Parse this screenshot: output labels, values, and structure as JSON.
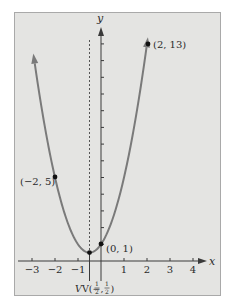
{
  "chart_data": {
    "type": "line",
    "title": "",
    "function": "y = 2x^2 + 2x + 1",
    "xlabel": "x",
    "ylabel": "y",
    "xlim": [
      -3.2,
      4.7
    ],
    "ylim": [
      -1,
      13.8
    ],
    "x_ticks": [
      -3,
      -2,
      -1,
      1,
      2,
      3,
      4
    ],
    "x_tick_labels": [
      "−3",
      "−2",
      "−1",
      "1",
      "2",
      "3",
      "4"
    ],
    "y_ticks": [
      1,
      2,
      3,
      4,
      5,
      6,
      7,
      8,
      9,
      10,
      11,
      12,
      13
    ],
    "y_tick_labels": [],
    "grid": false,
    "axis_of_symmetry": -0.5,
    "series": [
      {
        "name": "parabola",
        "x": [
          -2.95,
          -2,
          -1,
          -0.5,
          0,
          1,
          2,
          2.05
        ],
        "y": [
          12.5,
          5,
          1,
          0.5,
          1,
          5,
          13,
          13.5
        ]
      }
    ],
    "points": [
      {
        "x": 2,
        "y": 13,
        "label": "(2, 13)"
      },
      {
        "x": -2,
        "y": 5,
        "label": "(−2, 5)"
      },
      {
        "x": 0,
        "y": 1,
        "label": "(0, 1)"
      },
      {
        "x": -0.5,
        "y": 0.5,
        "label": "V(−½, ½)"
      }
    ]
  },
  "labels": {
    "x_axis": "x",
    "y_axis": "y",
    "p1": "(2, 13)",
    "p2": "(−2, 5)",
    "p3": "(0, 1)",
    "vertex_prefix": "V(−",
    "vertex_frac1_num": "1",
    "vertex_frac1_den": "2",
    "vertex_comma": ",",
    "vertex_frac2_num": "1",
    "vertex_frac2_den": "2",
    "vertex_close": ")"
  },
  "colors": {
    "panel_bg": "#e4e4e2",
    "panel_border": "#a9a9a9",
    "curve": "#7a7a7a",
    "axis": "#3a3a3a",
    "point": "#111111"
  }
}
